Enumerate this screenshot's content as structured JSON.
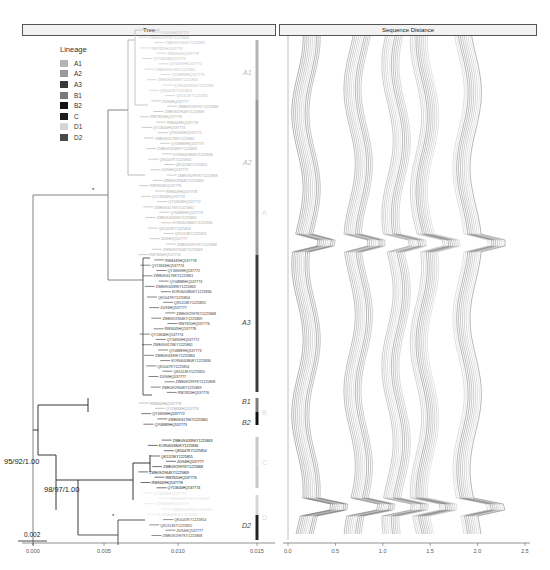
{
  "panels": {
    "tree": {
      "title": "Tree"
    },
    "distance": {
      "title": "Sequence Distance"
    }
  },
  "legend": {
    "title": "Lineage",
    "items": [
      {
        "label": "A1",
        "color": "#b5b5b5"
      },
      {
        "label": "A2",
        "color": "#9a9a9a"
      },
      {
        "label": "A3",
        "color": "#3a3a3a"
      },
      {
        "label": "B1",
        "color": "#7a7a7a"
      },
      {
        "label": "B2",
        "color": "#111111"
      },
      {
        "label": "C",
        "color": "#1c1c1c"
      },
      {
        "label": "D1",
        "color": "#d6d6d6"
      },
      {
        "label": "D2",
        "color": "#4a4a4a"
      }
    ]
  },
  "tree": {
    "node_support": [
      {
        "label": "95/92/1.00"
      },
      {
        "label": "98/97/1.00"
      }
    ],
    "scale_bar": "0.002",
    "x_ticks": [
      "0.000",
      "0.005",
      "0.010",
      "0.015"
    ],
    "clade_labels_inner": [
      "A1",
      "A2",
      "A3",
      "B1",
      "B2",
      "C",
      "D1",
      "D2"
    ],
    "clade_labels_outer": [
      "A",
      "B",
      "C",
      "D"
    ],
    "tip_label_samples": [
      "Z0/94HQ537777",
      "ZWE09/2997KY1225868",
      "ZWE09/2964KY1225869",
      "RW7820HQ537776",
      "RW8449HQ537778",
      "QY13634HQ537774",
      "QY34909HQ537772",
      "ZWE09/4176KY1225861",
      "QY08889HQ537773",
      "ZWE09/4339KY1225863",
      "KOR06/0380KY1225836",
      "QK5047KY1225854",
      "QK5113KY1225855"
    ]
  },
  "chart_data": {
    "type": "line",
    "title": "Sequence Distance",
    "xlabel": "",
    "ylabel": "",
    "x_ticks": [
      "0.0",
      "0.5",
      "1.0",
      "1.5",
      "2.0",
      "2.5"
    ],
    "xlim": [
      0,
      2.5
    ],
    "series_bands": [
      {
        "name": "band1",
        "center": 0.2
      },
      {
        "name": "band2",
        "center": 0.75
      },
      {
        "name": "band3",
        "center": 1.15
      },
      {
        "name": "band4",
        "center": 1.45
      },
      {
        "name": "band5",
        "center": 1.9
      }
    ]
  }
}
